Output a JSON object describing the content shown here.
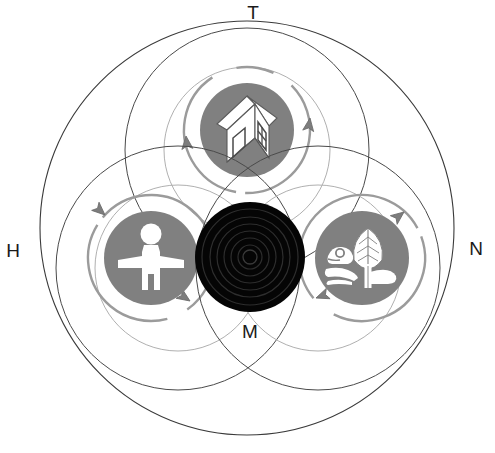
{
  "diagram": {
    "labels": {
      "top": "T",
      "left": "H",
      "right": "N",
      "center_bottom": "M"
    },
    "colors": {
      "icon_disc_gray": "#808080",
      "icon_glyph_white": "#ffffff",
      "center_black": "#050505",
      "center_ring": "#2e2e2e",
      "outline_dark": "#3a3a3a",
      "outline_light": "#9a9a9a",
      "arrow_gray": "#7d7d7d",
      "background": "#ffffff"
    },
    "outer_circle": {
      "name": "outer-boundary-circle",
      "cx": 247,
      "cy": 228,
      "r": 207
    },
    "lobes": [
      {
        "key": "top",
        "label": "T",
        "icon_name": "house-icon",
        "icon_description": "isometric three-dimensional house with door and window",
        "outer_cx": 247,
        "outer_cy": 150,
        "outer_r": 122,
        "inner_cx": 247,
        "inner_cy": 150,
        "inner_r": 83,
        "disc_cx": 247,
        "disc_cy": 130,
        "disc_r": 47,
        "arrow_r": 63,
        "arrow_rotation": 0
      },
      {
        "key": "left",
        "label": "H",
        "icon_name": "person-icon",
        "icon_description": "standing human figure with outstretched arms",
        "outer_cx": 178,
        "outer_cy": 268,
        "outer_r": 122,
        "inner_cx": 178,
        "inner_cy": 268,
        "inner_r": 83,
        "disc_cx": 151,
        "disc_cy": 258,
        "disc_r": 47,
        "arrow_r": 63,
        "arrow_rotation": 240
      },
      {
        "key": "right",
        "label": "N",
        "icon_name": "nature-leaf-frog-icon",
        "icon_description": "leaf plant with frog on ground representing nature",
        "outer_cx": 318,
        "outer_cy": 268,
        "outer_r": 122,
        "inner_cx": 318,
        "inner_cy": 268,
        "inner_r": 83,
        "disc_cx": 362,
        "disc_cy": 258,
        "disc_r": 47,
        "arrow_r": 63,
        "arrow_rotation": 120
      }
    ],
    "center": {
      "name": "center-black-disc",
      "label": "M",
      "cx": 250,
      "cy": 257,
      "r": 55,
      "rings": [
        48,
        40,
        33,
        26,
        19,
        12,
        7
      ]
    },
    "label_positions": {
      "top": {
        "x": 253,
        "y": 14
      },
      "left": {
        "x": 13,
        "y": 252
      },
      "right": {
        "x": 476,
        "y": 250
      },
      "center_bottom": {
        "x": 250,
        "y": 333
      }
    }
  }
}
